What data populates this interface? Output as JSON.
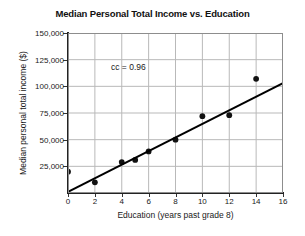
{
  "chart_data": {
    "type": "scatter",
    "title": "Median Personal Total Income vs. Education",
    "xlabel": "Education (years past grade 8)",
    "ylabel": "Median personal total income ($)",
    "xlim": [
      0,
      16
    ],
    "ylim": [
      0,
      150000
    ],
    "xticks": [
      0,
      2,
      4,
      6,
      8,
      10,
      12,
      14,
      16
    ],
    "xtick_labels": [
      "0",
      "2",
      "4",
      "6",
      "8",
      "10",
      "12",
      "14",
      "16"
    ],
    "yticks": [
      0,
      25000,
      50000,
      75000,
      100000,
      125000,
      150000
    ],
    "ytick_labels": [
      "",
      "25,000",
      "50,000",
      "75,000",
      "100,000",
      "125,000",
      "150,000"
    ],
    "grid": true,
    "legend": "none",
    "annotations": [
      {
        "text": "cc = 0.96",
        "x": 3.2,
        "y": 117000
      }
    ],
    "series": [
      {
        "name": "Median personal total income",
        "type": "scatter",
        "marker": "filled-circle",
        "color": "#111111",
        "points": [
          {
            "x": 0,
            "y": 20000
          },
          {
            "x": 2,
            "y": 10000
          },
          {
            "x": 4,
            "y": 29000
          },
          {
            "x": 5,
            "y": 31000
          },
          {
            "x": 6,
            "y": 39000
          },
          {
            "x": 8,
            "y": 50000
          },
          {
            "x": 10,
            "y": 72000
          },
          {
            "x": 12,
            "y": 73000
          },
          {
            "x": 14,
            "y": 107000
          }
        ]
      },
      {
        "name": "Line of best fit",
        "type": "line",
        "color": "#000000",
        "points": [
          {
            "x": 0,
            "y": 1000
          },
          {
            "x": 16,
            "y": 103000
          }
        ]
      }
    ]
  }
}
